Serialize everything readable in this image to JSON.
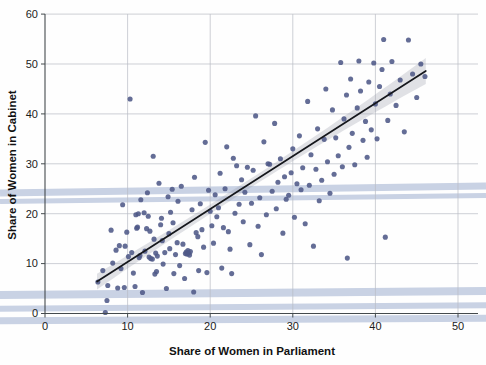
{
  "chart_data": {
    "type": "scatter",
    "title": "",
    "xlabel": "Share of Women in Parliament",
    "ylabel": "Share of Women in Cabinet",
    "xlim": [
      0,
      52
    ],
    "ylim": [
      0,
      60
    ],
    "xticks": [
      0,
      10,
      20,
      30,
      40,
      50
    ],
    "yticks": [
      0,
      10,
      20,
      30,
      40,
      50,
      60
    ],
    "grid": true,
    "legend": "none",
    "marker_color": "#4e5987",
    "fit_line_color": "#15171c",
    "ci_band_color": "#9aa0ad",
    "fit_line": {
      "label": "linear regression fit",
      "x_start": 6.3,
      "y_start": 6.4,
      "x_end": 46.1,
      "y_end": 48.6,
      "slope": 1.06,
      "intercept": -0.28,
      "ci_half_width_start": 1.9,
      "ci_half_width_mid": 0.9,
      "ci_half_width_end": 2.6
    },
    "points": [
      [
        6.4,
        6.3
      ],
      [
        7.0,
        8.6
      ],
      [
        7.3,
        0.2
      ],
      [
        7.5,
        2.6
      ],
      [
        7.6,
        5.6
      ],
      [
        8.0,
        16.7
      ],
      [
        8.2,
        10.1
      ],
      [
        8.6,
        12.7
      ],
      [
        8.8,
        5.1
      ],
      [
        9.0,
        13.6
      ],
      [
        9.2,
        9.0
      ],
      [
        9.4,
        21.8
      ],
      [
        9.6,
        5.2
      ],
      [
        9.7,
        13.5
      ],
      [
        9.9,
        16.3
      ],
      [
        10.1,
        11.4
      ],
      [
        10.3,
        43.0
      ],
      [
        10.5,
        12.2
      ],
      [
        10.7,
        8.1
      ],
      [
        10.9,
        5.4
      ],
      [
        11.0,
        19.8
      ],
      [
        11.1,
        17.1
      ],
      [
        11.2,
        17.3
      ],
      [
        11.3,
        20.0
      ],
      [
        11.4,
        11.2
      ],
      [
        11.5,
        11.6
      ],
      [
        11.6,
        22.8
      ],
      [
        11.8,
        4.2
      ],
      [
        12.0,
        20.2
      ],
      [
        12.1,
        12.5
      ],
      [
        12.3,
        17.0
      ],
      [
        12.4,
        24.2
      ],
      [
        12.5,
        19.5
      ],
      [
        12.6,
        11.3
      ],
      [
        12.7,
        16.5
      ],
      [
        12.8,
        11.0
      ],
      [
        13.0,
        10.9
      ],
      [
        13.1,
        31.5
      ],
      [
        13.2,
        14.9
      ],
      [
        13.3,
        7.9
      ],
      [
        13.4,
        12.1
      ],
      [
        13.5,
        8.4
      ],
      [
        13.6,
        11.5
      ],
      [
        13.8,
        26.1
      ],
      [
        14.0,
        17.8
      ],
      [
        14.1,
        19.1
      ],
      [
        14.2,
        14.6
      ],
      [
        14.3,
        9.9
      ],
      [
        14.5,
        12.2
      ],
      [
        14.7,
        5.0
      ],
      [
        14.9,
        23.4
      ],
      [
        15.0,
        16.0
      ],
      [
        15.1,
        13.0
      ],
      [
        15.2,
        20.3
      ],
      [
        15.4,
        24.9
      ],
      [
        15.5,
        18.2
      ],
      [
        15.6,
        8.0
      ],
      [
        15.8,
        11.8
      ],
      [
        16.0,
        14.2
      ],
      [
        16.1,
        22.5
      ],
      [
        16.3,
        9.6
      ],
      [
        16.5,
        25.5
      ],
      [
        16.7,
        13.9
      ],
      [
        16.9,
        7.0
      ],
      [
        17.0,
        12.0
      ],
      [
        17.1,
        12.3
      ],
      [
        17.2,
        11.9
      ],
      [
        17.3,
        12.6
      ],
      [
        17.4,
        12.1
      ],
      [
        17.5,
        11.7
      ],
      [
        17.6,
        12.4
      ],
      [
        17.8,
        20.8
      ],
      [
        18.0,
        4.3
      ],
      [
        18.1,
        27.3
      ],
      [
        18.3,
        16.2
      ],
      [
        18.5,
        15.4
      ],
      [
        18.6,
        8.6
      ],
      [
        18.8,
        22.0
      ],
      [
        19.0,
        16.8
      ],
      [
        19.2,
        13.3
      ],
      [
        19.4,
        34.3
      ],
      [
        19.6,
        8.2
      ],
      [
        19.8,
        24.7
      ],
      [
        20.0,
        20.5
      ],
      [
        20.2,
        17.6
      ],
      [
        20.4,
        14.1
      ],
      [
        20.6,
        23.8
      ],
      [
        20.8,
        19.4
      ],
      [
        21.0,
        21.2
      ],
      [
        21.2,
        28.1
      ],
      [
        21.4,
        9.1
      ],
      [
        21.6,
        17.2
      ],
      [
        21.8,
        25.0
      ],
      [
        22.0,
        33.4
      ],
      [
        22.2,
        16.4
      ],
      [
        22.4,
        12.9
      ],
      [
        22.6,
        8.0
      ],
      [
        22.8,
        31.1
      ],
      [
        23.0,
        20.1
      ],
      [
        23.2,
        29.6
      ],
      [
        23.5,
        21.9
      ],
      [
        23.8,
        26.8
      ],
      [
        24.0,
        18.4
      ],
      [
        24.2,
        24.3
      ],
      [
        24.5,
        29.3
      ],
      [
        24.8,
        13.8
      ],
      [
        25.0,
        22.1
      ],
      [
        25.2,
        28.7
      ],
      [
        25.5,
        39.6
      ],
      [
        25.8,
        17.5
      ],
      [
        26.0,
        23.2
      ],
      [
        26.2,
        11.8
      ],
      [
        26.5,
        34.4
      ],
      [
        26.8,
        19.8
      ],
      [
        27.0,
        30.0
      ],
      [
        27.2,
        29.9
      ],
      [
        27.5,
        24.5
      ],
      [
        27.8,
        38.1
      ],
      [
        28.0,
        21.0
      ],
      [
        28.2,
        26.3
      ],
      [
        28.5,
        31.0
      ],
      [
        28.8,
        16.1
      ],
      [
        29.0,
        27.4
      ],
      [
        29.2,
        22.9
      ],
      [
        29.5,
        23.7
      ],
      [
        29.8,
        28.2
      ],
      [
        30.0,
        33.0
      ],
      [
        30.2,
        19.3
      ],
      [
        30.5,
        26.0
      ],
      [
        30.8,
        35.6
      ],
      [
        31.0,
        24.8
      ],
      [
        31.2,
        29.2
      ],
      [
        31.5,
        18.0
      ],
      [
        31.8,
        42.5
      ],
      [
        32.0,
        25.7
      ],
      [
        32.2,
        31.8
      ],
      [
        32.5,
        13.5
      ],
      [
        32.8,
        28.9
      ],
      [
        33.0,
        37.0
      ],
      [
        33.2,
        22.6
      ],
      [
        33.5,
        26.7
      ],
      [
        33.8,
        34.9
      ],
      [
        34.0,
        45.0
      ],
      [
        34.2,
        30.4
      ],
      [
        34.5,
        24.1
      ],
      [
        34.8,
        40.8
      ],
      [
        35.0,
        27.9
      ],
      [
        35.2,
        35.2
      ],
      [
        35.5,
        31.6
      ],
      [
        35.8,
        50.3
      ],
      [
        36.0,
        29.4
      ],
      [
        36.2,
        39.0
      ],
      [
        36.5,
        43.8
      ],
      [
        36.6,
        11.1
      ],
      [
        36.8,
        33.3
      ],
      [
        37.0,
        47.0
      ],
      [
        37.2,
        36.1
      ],
      [
        37.5,
        29.8
      ],
      [
        37.8,
        41.2
      ],
      [
        38.0,
        50.6
      ],
      [
        38.2,
        44.6
      ],
      [
        38.5,
        34.7
      ],
      [
        38.8,
        38.5
      ],
      [
        39.0,
        31.3
      ],
      [
        39.2,
        46.4
      ],
      [
        39.5,
        36.8
      ],
      [
        39.8,
        50.2
      ],
      [
        40.0,
        42.0
      ],
      [
        40.2,
        35.0
      ],
      [
        40.5,
        45.5
      ],
      [
        40.8,
        48.9
      ],
      [
        41.0,
        54.9
      ],
      [
        41.2,
        15.3
      ],
      [
        41.5,
        38.7
      ],
      [
        41.8,
        44.0
      ],
      [
        42.0,
        50.5
      ],
      [
        42.5,
        41.7
      ],
      [
        43.0,
        46.8
      ],
      [
        43.5,
        36.4
      ],
      [
        44.0,
        54.8
      ],
      [
        44.5,
        48.0
      ],
      [
        45.0,
        43.3
      ],
      [
        45.5,
        50.0
      ],
      [
        46.0,
        47.5
      ]
    ]
  },
  "axes": {
    "x_tick_labels": [
      "0",
      "10",
      "20",
      "30",
      "40",
      "50"
    ],
    "y_tick_labels": [
      "0",
      "10",
      "20",
      "30",
      "40",
      "50",
      "60"
    ],
    "x_axis_title": "Share of Women in Parliament",
    "y_axis_title": "Share of Women in Cabinet"
  }
}
